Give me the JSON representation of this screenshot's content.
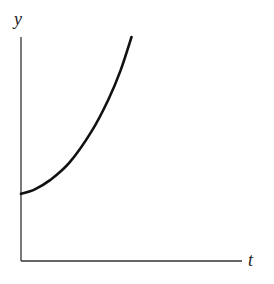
{
  "chart_data": {
    "type": "line",
    "title": "",
    "xlabel": "t",
    "ylabel": "y",
    "grid": false,
    "legend": null,
    "xticks": [],
    "yticks": [],
    "series": [
      {
        "name": "y(t)",
        "x": [
          0,
          0.125,
          0.26,
          0.44,
          0.64,
          0.79,
          0.9,
          1.0
        ],
        "values": [
          0.3,
          0.32,
          0.36,
          0.44,
          0.58,
          0.72,
          0.85,
          1.0
        ]
      }
    ],
    "xlim": [
      0,
      2.0
    ],
    "ylim": [
      0,
      1.0
    ],
    "colors": {
      "curve": "#111111",
      "axes": "#333333"
    }
  }
}
